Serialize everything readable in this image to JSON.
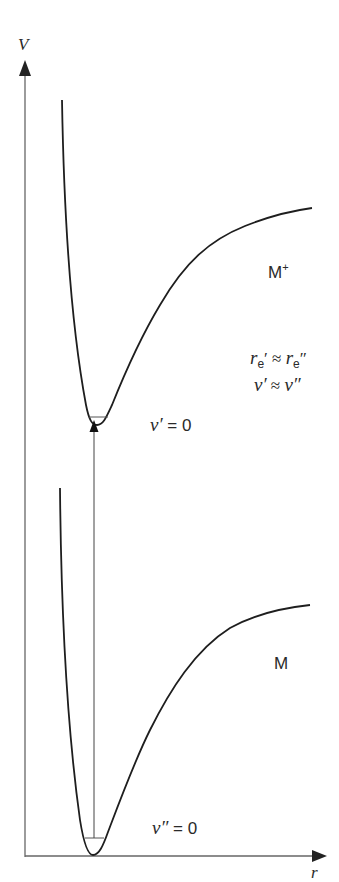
{
  "axes": {
    "y_label": "V",
    "x_label": "r"
  },
  "states": {
    "upper": {
      "name": "M",
      "charge": "+",
      "level_symbol": "v′",
      "level_value": "= 0"
    },
    "lower": {
      "name": "M",
      "level_symbol": "v″",
      "level_value": "= 0"
    }
  },
  "relations": {
    "re": {
      "lhs_symbol": "r",
      "lhs_sub": "e",
      "lhs_prime": "′",
      "op": "≈",
      "rhs_symbol": "r",
      "rhs_sub": "e",
      "rhs_prime": "″"
    },
    "nu": {
      "lhs": "ν′",
      "op": "≈",
      "rhs": "ν″"
    }
  },
  "colors": {
    "curve": "#1e1e1e",
    "axis": "#555555",
    "text": "#2a2a2a",
    "background": "#ffffff"
  }
}
